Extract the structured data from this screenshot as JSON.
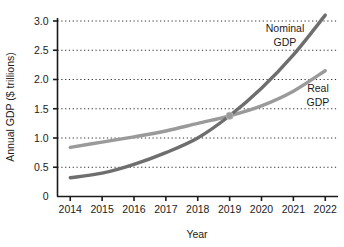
{
  "chart_data": {
    "type": "line",
    "title": "",
    "xlabel": "Year",
    "ylabel": "Annual GDP ($ trillions)",
    "x": [
      2014,
      2015,
      2016,
      2017,
      2018,
      2019,
      2020,
      2021,
      2022
    ],
    "xticklabels": [
      "2014",
      "2015",
      "2016",
      "2017",
      "2018",
      "2019",
      "2020",
      "2021",
      "2022"
    ],
    "yticklabels": [
      "0",
      "0.5",
      "1.0",
      "1.5",
      "2.0",
      "2.5",
      "3.0"
    ],
    "yticks": [
      0,
      0.5,
      1.0,
      1.5,
      2.0,
      2.5,
      3.0
    ],
    "xlim": [
      2013.6,
      2022.4
    ],
    "ylim": [
      0,
      3.2
    ],
    "grid": "horizontal-dotted",
    "legend": "inline-labels",
    "series": [
      {
        "name": "Nominal GDP",
        "label": "Nominal\nGDP",
        "label_line1": "Nominal",
        "label_line2": "GDP",
        "color": "#6e6e6e",
        "values": [
          0.32,
          0.4,
          0.55,
          0.75,
          1.0,
          1.38,
          1.85,
          2.42,
          3.1
        ]
      },
      {
        "name": "Real GDP",
        "label": "Real\nGDP",
        "label_line1": "Real",
        "label_line2": "GDP",
        "color": "#9a9a9a",
        "values": [
          0.84,
          0.93,
          1.02,
          1.12,
          1.25,
          1.38,
          1.55,
          1.8,
          2.15
        ]
      }
    ],
    "annotations": [
      {
        "name": "intersection-marker",
        "x": 2019,
        "y": 1.38,
        "color": "#9a9a9a"
      }
    ],
    "colors": {
      "axis": "#1b1b1b",
      "gridline": "#2b2b2b",
      "background": "#ffffff",
      "nominal": "#6e6e6e",
      "real": "#9a9a9a"
    }
  }
}
